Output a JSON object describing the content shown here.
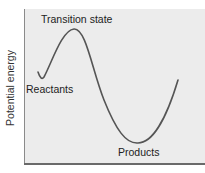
{
  "diagram": {
    "y_axis_label": "Potential energy",
    "labels": {
      "transition_state": "Transition state",
      "reactants": "Reactants",
      "products": "Products"
    },
    "colors": {
      "plot_background": "#ececec",
      "curve": "#555555",
      "axis": "#6a6a6a"
    }
  }
}
